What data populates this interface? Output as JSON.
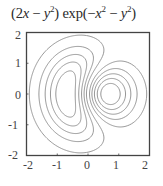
{
  "chart_data": {
    "type": "contour",
    "function": "(2x - y^2) * exp(-x^2 - y^2)",
    "xlabel": "",
    "ylabel": "",
    "xlim": [
      -2,
      2
    ],
    "ylim": [
      -2,
      2
    ],
    "x_ticks": [
      "-2",
      "-1",
      "0",
      "1",
      "2"
    ],
    "y_ticks": [
      "2",
      "1",
      "0",
      "-1",
      "-2"
    ],
    "contour_levels": [
      -0.7,
      -0.55,
      -0.4,
      -0.25,
      -0.1,
      0.1,
      0.25,
      0.4,
      0.55,
      0.7
    ],
    "grid": false,
    "legend": "none",
    "line_color": "#8a8a8a",
    "frame_color": "#444444"
  },
  "title": {
    "part1": "(2",
    "x1": "x",
    "minus1": " − ",
    "y1": "y",
    "sup1": "2",
    "part2": ") exp(−",
    "x2": "x",
    "sup2": "2",
    "minus2": " − ",
    "y2": "y",
    "sup3": "2",
    "part3": ")"
  }
}
